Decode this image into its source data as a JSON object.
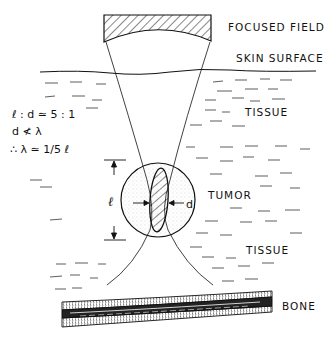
{
  "diagram": {
    "type": "ultrasound focused-field hyperthermia schematic",
    "labels": {
      "focused_field": "FOCUSED FIELD",
      "skin_surface": "SKIN SURFACE",
      "tissue_upper": "TISSUE",
      "tumor": "TUMOR",
      "tissue_lower": "TISSUE",
      "bone": "BONE"
    },
    "equations": {
      "line1": "ℓ : d ≃ 5 : 1",
      "line2": "d ≮ λ",
      "line3": "∴ λ ≃ 1/5 ℓ"
    },
    "dimensions": {
      "length_symbol": "ℓ",
      "width_symbol": "d"
    },
    "colors": {
      "ink": "#111111",
      "background": "#ffffff",
      "stipple": "#9a9a9a"
    }
  }
}
